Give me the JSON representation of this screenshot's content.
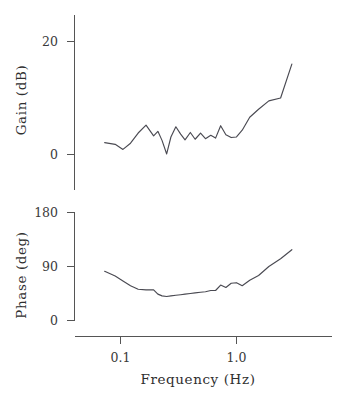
{
  "chart_data": [
    {
      "type": "line",
      "title": "",
      "xlabel": "",
      "ylabel": "Gain  (dB)",
      "panel": "top",
      "xscale": "log",
      "xlim": [
        0.06,
        4.0
      ],
      "ylim": [
        -4,
        24
      ],
      "grid": false,
      "legend": "none",
      "xticks": [
        0.1,
        1.0
      ],
      "xticklabels": [
        "0.1",
        "1.0"
      ],
      "yticks": [
        0,
        20
      ],
      "yticklabels": [
        "0",
        "20"
      ],
      "x": [
        0.073,
        0.09,
        0.105,
        0.122,
        0.142,
        0.166,
        0.193,
        0.21,
        0.228,
        0.25,
        0.272,
        0.3,
        0.33,
        0.36,
        0.4,
        0.44,
        0.49,
        0.54,
        0.6,
        0.66,
        0.73,
        0.81,
        0.9,
        1.0,
        1.12,
        1.3,
        1.55,
        1.9,
        2.4,
        3.0
      ],
      "values": [
        2.1,
        1.8,
        0.9,
        2.0,
        3.8,
        5.2,
        3.3,
        4.1,
        2.5,
        0.1,
        3.1,
        4.9,
        3.6,
        2.6,
        3.9,
        2.7,
        3.8,
        2.8,
        3.4,
        2.9,
        5.1,
        3.5,
        3.0,
        3.1,
        4.3,
        6.6,
        8.0,
        9.5,
        10.0,
        16.0
      ]
    },
    {
      "type": "line",
      "title": "",
      "xlabel": "Frequency  (Hz)",
      "ylabel": "Phase  (deg)",
      "panel": "bottom",
      "xscale": "log",
      "xlim": [
        0.06,
        4.0
      ],
      "ylim": [
        0,
        180
      ],
      "grid": false,
      "legend": "none",
      "xticks": [
        0.1,
        1.0
      ],
      "xticklabels": [
        "0.1",
        "1.0"
      ],
      "yticks": [
        0,
        90,
        180
      ],
      "yticklabels": [
        "0",
        "90",
        "180"
      ],
      "x": [
        0.073,
        0.09,
        0.105,
        0.122,
        0.142,
        0.166,
        0.193,
        0.21,
        0.228,
        0.25,
        0.272,
        0.3,
        0.33,
        0.36,
        0.4,
        0.44,
        0.49,
        0.54,
        0.6,
        0.66,
        0.73,
        0.81,
        0.9,
        1.0,
        1.12,
        1.3,
        1.55,
        1.9,
        2.4,
        3.0
      ],
      "values": [
        82,
        74,
        66,
        58,
        52,
        51,
        51,
        44,
        41,
        40,
        41,
        42,
        43,
        44,
        45,
        46,
        47,
        48,
        50,
        50,
        59,
        55,
        62,
        63,
        58,
        67,
        75,
        90,
        103,
        118
      ]
    }
  ],
  "labels": {
    "gain_axis_title": "Gain  (dB)",
    "phase_axis_title": "Phase  (deg)",
    "frequency_axis_title": "Frequency  (Hz)",
    "gain_tick_20": "20",
    "gain_tick_0": "0",
    "phase_tick_180": "180",
    "phase_tick_90": "90",
    "phase_tick_0": "0",
    "freq_tick_01": "0.1",
    "freq_tick_10": "1.0"
  },
  "colors": {
    "background": "#ffffff",
    "axis": "#555555",
    "data_line": "#4a4a52",
    "text": "#2f2f2f"
  }
}
